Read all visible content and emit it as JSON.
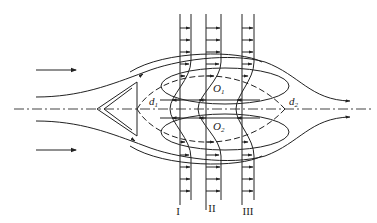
{
  "diagram": {
    "colors": {
      "stroke": "#222222",
      "background": "#ffffff"
    },
    "labels": {
      "d1": {
        "main": "d",
        "sub": "1"
      },
      "d2": {
        "main": "d",
        "sub": "2"
      },
      "o1": {
        "main": "O",
        "sub": "1"
      },
      "o2": {
        "main": "O",
        "sub": "2"
      }
    },
    "sections": [
      {
        "id": "I",
        "label": "I"
      },
      {
        "id": "II",
        "label": "II"
      },
      {
        "id": "III",
        "label": "III"
      }
    ],
    "elements": {
      "bluff_body": "V-shaped flame holder",
      "centerline": "dash-dot axis",
      "incoming_flow_arrows": 2,
      "recirculation_zones": [
        "O1",
        "O2"
      ]
    }
  }
}
